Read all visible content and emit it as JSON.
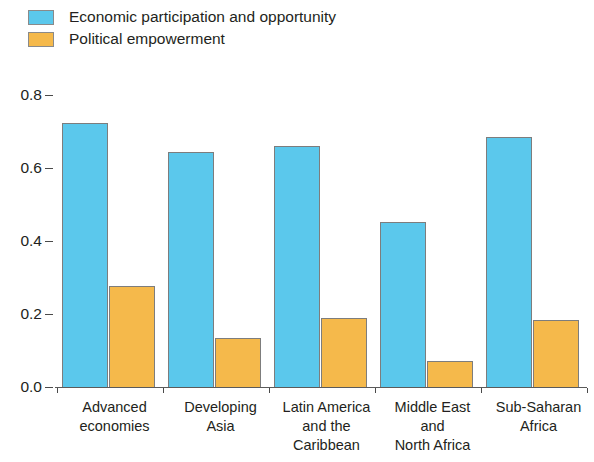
{
  "legend": {
    "items": [
      {
        "label": "Economic participation and opportunity",
        "color": "#5BC8EC",
        "icon": "legend-swatch-icon"
      },
      {
        "label": "Political empowerment",
        "color": "#F5B94B",
        "icon": "legend-swatch-icon"
      }
    ]
  },
  "chart_data": {
    "type": "bar",
    "title": "",
    "xlabel": "",
    "ylabel": "",
    "ylim": [
      0.0,
      0.8
    ],
    "yticks": [
      "0.0",
      "0.2",
      "0.4",
      "0.6",
      "0.8"
    ],
    "ytick_values": [
      0.0,
      0.2,
      0.4,
      0.6,
      0.8
    ],
    "grid": false,
    "legend_position": "top-left",
    "categories": [
      "Advanced economies",
      "Developing Asia",
      "Latin America and the Caribbean",
      "Middle East and North Africa",
      "Sub-Saharan Africa"
    ],
    "category_lines": [
      [
        "Advanced",
        "economies"
      ],
      [
        "Developing",
        "Asia"
      ],
      [
        "Latin America",
        "and the",
        "Caribbean"
      ],
      [
        "Middle East",
        "and",
        "North Africa"
      ],
      [
        "Sub-Saharan",
        "Africa"
      ]
    ],
    "series": [
      {
        "name": "Economic participation and opportunity",
        "color": "#5BC8EC",
        "values": [
          0.723,
          0.644,
          0.66,
          0.452,
          0.685
        ]
      },
      {
        "name": "Political empowerment",
        "color": "#F5B94B",
        "values": [
          0.277,
          0.134,
          0.189,
          0.071,
          0.184
        ]
      }
    ]
  }
}
